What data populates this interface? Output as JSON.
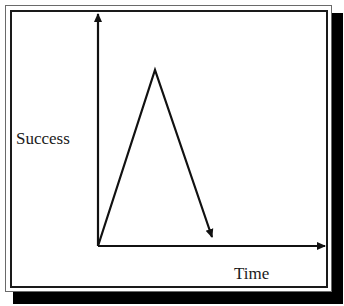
{
  "diagram": {
    "y_axis_label": "Success",
    "x_axis_label": "Time",
    "curve": {
      "start": [
        98,
        246
      ],
      "peak": [
        155,
        70
      ],
      "end": [
        213,
        238
      ],
      "description": "rises sharply to a peak then falls"
    },
    "colors": {
      "line": "#111111",
      "shadow": "#000000",
      "background": "#ffffff"
    }
  }
}
